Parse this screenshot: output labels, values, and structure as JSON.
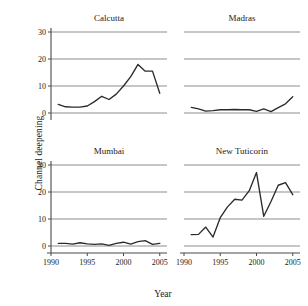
{
  "figure": {
    "ylabel": "Channel deepening",
    "xlabel": "Year"
  },
  "chart_data": {
    "type": "line",
    "title": "",
    "xlabel": "Year",
    "ylabel": "Channel deepening",
    "xlim": [
      1990,
      2006
    ],
    "ylim": [
      0,
      30
    ],
    "xticks": [
      1990,
      1995,
      2000,
      2005
    ],
    "yticks": [
      0,
      10,
      20,
      30
    ],
    "xtick_labels": [
      "1990",
      "1995",
      "2000",
      "2005"
    ],
    "ytick_labels": [
      "0",
      "10",
      "20",
      "30"
    ],
    "grid": true,
    "legend": "none",
    "layout": "2x2 small multiples",
    "panels": [
      {
        "title": "Calcutta",
        "position": "top-left",
        "x": [
          1991,
          1992,
          1993,
          1994,
          1995,
          1996,
          1997,
          1998,
          1999,
          2000,
          2001,
          2002,
          2003,
          2004,
          2005
        ],
        "values": [
          3.2,
          2.3,
          2.2,
          2.2,
          2.6,
          4.2,
          6.2,
          5.0,
          7.0,
          10.0,
          13.5,
          18.0,
          15.5,
          15.5,
          7.3
        ]
      },
      {
        "title": "Madras",
        "position": "top-right",
        "x": [
          1991,
          1992,
          1993,
          1994,
          1995,
          1996,
          1997,
          1998,
          1999,
          2000,
          2001,
          2002,
          2003,
          2004,
          2005
        ],
        "values": [
          2.1,
          1.5,
          0.7,
          0.9,
          1.2,
          1.2,
          1.3,
          1.2,
          1.2,
          0.6,
          1.5,
          0.5,
          2.0,
          3.4,
          6.0
        ]
      },
      {
        "title": "Mumbai",
        "position": "bottom-left",
        "x": [
          1991,
          1992,
          1993,
          1994,
          1995,
          1996,
          1997,
          1998,
          1999,
          2000,
          2001,
          2002,
          2003,
          2004,
          2005
        ],
        "values": [
          1.0,
          1.0,
          0.7,
          1.2,
          0.8,
          0.6,
          0.8,
          0.2,
          1.0,
          1.4,
          0.7,
          1.6,
          2.0,
          0.6,
          1.0
        ]
      },
      {
        "title": "New Tuticorin",
        "position": "bottom-right",
        "x": [
          1991,
          1992,
          1993,
          1994,
          1995,
          1996,
          1997,
          1998,
          1999,
          2000,
          2001,
          2002,
          2003,
          2004,
          2005
        ],
        "values": [
          4.2,
          4.3,
          7.0,
          3.3,
          10.5,
          14.5,
          17.3,
          17.0,
          20.5,
          27.2,
          11.0,
          16.5,
          22.5,
          23.5,
          19.0
        ]
      }
    ]
  },
  "colors": {
    "series": "#2b2b2b",
    "grid": "#8e8e8e",
    "axis": "#4a4a4a",
    "background": "#ffffff"
  }
}
